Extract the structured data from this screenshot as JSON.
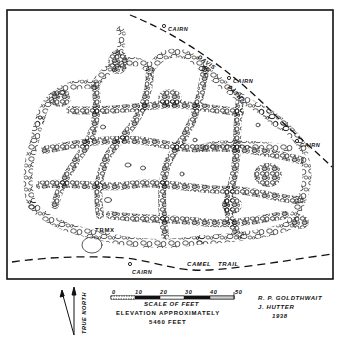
{
  "map": {
    "frame": {
      "x": 7,
      "y": 10,
      "width": 326,
      "height": 269,
      "stroke": "#111111"
    },
    "trails": [
      {
        "name": "DAVIS PATH",
        "words": [
          "DAVIS",
          "PATH"
        ]
      },
      {
        "name": "CAMEL TRAIL",
        "words": [
          "CAMEL",
          "TRAIL"
        ]
      }
    ],
    "cairns": [
      {
        "label": "CAIRN",
        "x": 164,
        "y": 26
      },
      {
        "label": "CAIRN",
        "x": 229,
        "y": 78
      },
      {
        "label": "CAIRN",
        "x": 297,
        "y": 141
      },
      {
        "label": "CAIRN",
        "x": 130,
        "y": 264
      }
    ],
    "benchmark": {
      "label": "TBM",
      "marker": "X"
    },
    "terrain": "stone-polygon network (sorted patterned ground)"
  },
  "legend": {
    "scale": {
      "ticks": [
        "0",
        "10",
        "20",
        "30",
        "40",
        "50"
      ],
      "title": "SCALE OF FEET"
    },
    "elevation_line1": "ELEVATION APPROXIMATELY",
    "elevation_line2": "5460 FEET",
    "north_label": "TRUE NORTH"
  },
  "credits": {
    "author1": "R. P. GOLDTHWAIT",
    "author2": "J. HUTTER",
    "year": "1938"
  },
  "colors": {
    "ink": "#111111",
    "paper": "#ffffff",
    "scale_light": "#cfcfcf"
  }
}
